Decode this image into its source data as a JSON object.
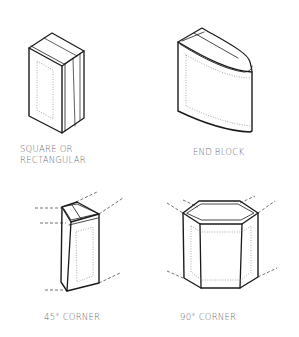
{
  "figures": [
    {
      "id": "square",
      "label_lines": [
        "SQUARE OR",
        "RECTANGULAR"
      ]
    },
    {
      "id": "end-block",
      "label_lines": [
        "END BLOCK"
      ]
    },
    {
      "id": "corner-45",
      "label_lines": [
        "45° CORNER"
      ]
    },
    {
      "id": "corner-90",
      "label_lines": [
        "90° CORNER"
      ]
    }
  ],
  "colors": {
    "ink": "#1a1a1a",
    "label": "#6a6a6a",
    "background": "#ffffff"
  }
}
